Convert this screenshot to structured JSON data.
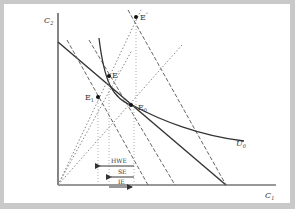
{
  "diagram": {
    "type": "economics-intertemporal-choice",
    "axes": {
      "x_label": "C",
      "x_sub": "1",
      "y_label": "C",
      "y_sub": "2"
    },
    "points": [
      {
        "id": "E0",
        "label": "E",
        "sub": "0",
        "sup": ""
      },
      {
        "id": "E1",
        "label": "E",
        "sub": "1",
        "sup": ""
      },
      {
        "id": "Eprime",
        "label": "E",
        "sub": "",
        "sup": "′"
      },
      {
        "id": "Edoubleprime",
        "label": "E",
        "sub": "",
        "sup": "″"
      }
    ],
    "curves": {
      "indifference_label": "U",
      "indifference_sub": "0"
    },
    "effects": [
      {
        "label": "HWE",
        "direction": "left"
      },
      {
        "label": "SE",
        "direction": "left"
      },
      {
        "label": "IE",
        "direction": "right"
      }
    ],
    "colors": {
      "background": "#c9c9c9",
      "panel": "#ffffff",
      "line": "#333333",
      "dashed": "#666666",
      "dotted": "#888888"
    }
  }
}
